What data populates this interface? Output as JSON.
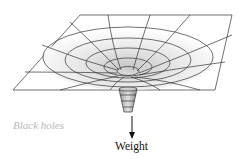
{
  "diagram": {
    "title": "Black holes",
    "labels": {
      "caption": "Black holes",
      "force": "Weight"
    },
    "elements": [
      "grid-sheet",
      "funnel",
      "throat-cone",
      "weight-arrow"
    ],
    "colors": {
      "line": "#333333",
      "caption": "#b8b8b8",
      "shade": "#d9d9d9"
    }
  }
}
